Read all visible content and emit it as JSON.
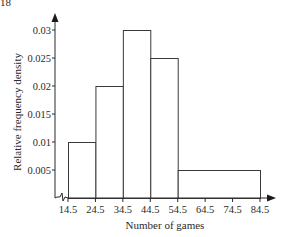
{
  "corner_label": "18",
  "chart_data": {
    "type": "bar",
    "subtype": "histogram",
    "title": "",
    "xlabel": "Number of games",
    "ylabel": "Relative frequency density",
    "x_ticks": [
      14.5,
      24.5,
      34.5,
      44.5,
      54.5,
      64.5,
      74.5,
      84.5
    ],
    "x_tick_labels": [
      "14.5",
      "24.5",
      "34.5",
      "44.5",
      "54.5",
      "64.5",
      "74.5",
      "84.5"
    ],
    "y_ticks": [
      0.005,
      0.01,
      0.015,
      0.02,
      0.025,
      0.03
    ],
    "y_tick_labels": [
      "0.005",
      "0.01",
      "0.015",
      "0.02",
      "0.025",
      "0.03"
    ],
    "xlim": [
      14.5,
      84.5
    ],
    "ylim": [
      0,
      0.03
    ],
    "x_axis_break": true,
    "grid": false,
    "legend": null,
    "bins": [
      {
        "from": 14.5,
        "to": 24.5,
        "density": 0.01
      },
      {
        "from": 24.5,
        "to": 34.5,
        "density": 0.02
      },
      {
        "from": 34.5,
        "to": 44.5,
        "density": 0.03
      },
      {
        "from": 44.5,
        "to": 54.5,
        "density": 0.025
      },
      {
        "from": 54.5,
        "to": 84.5,
        "density": 0.005
      }
    ],
    "categories": [
      "14.5-24.5",
      "24.5-34.5",
      "34.5-44.5",
      "44.5-54.5",
      "54.5-84.5"
    ],
    "values": [
      0.01,
      0.02,
      0.03,
      0.025,
      0.005
    ]
  },
  "colors": {
    "axis": "#2a2a2a",
    "bar_stroke": "#3a3a3a",
    "bar_fill": "#ffffff",
    "background": "#ffffff"
  }
}
